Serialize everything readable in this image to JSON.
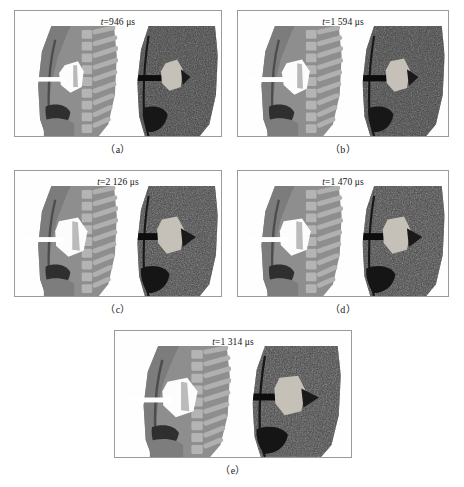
{
  "figure": {
    "type": "multi-panel-scientific-figure",
    "panel_count": 5,
    "background_color": "#ffffff",
    "border_color": "#9a9a9a"
  },
  "panels": [
    {
      "id": "a",
      "caption": "（a）",
      "time_label_prefix": "t",
      "time_label_equals": "=",
      "time_label_value": "946",
      "time_label_unit": "μs",
      "time_label_full": "t=946 μs"
    },
    {
      "id": "b",
      "caption": "（b）",
      "time_label_prefix": "t",
      "time_label_equals": "=",
      "time_label_value": "1 594",
      "time_label_unit": "μs",
      "time_label_full": "t=1 594 μs"
    },
    {
      "id": "c",
      "caption": "（c）",
      "time_label_prefix": "t",
      "time_label_equals": "=",
      "time_label_value": "2 126",
      "time_label_unit": "μs",
      "time_label_full": "t=2 126 μs"
    },
    {
      "id": "d",
      "caption": "（d）",
      "time_label_prefix": "t",
      "time_label_equals": "=",
      "time_label_value": "1 470",
      "time_label_unit": "μs",
      "time_label_full": "t=1 470 μs"
    },
    {
      "id": "e",
      "caption": "（e）",
      "time_label_prefix": "t",
      "time_label_equals": "=",
      "time_label_value": "1 314",
      "time_label_unit": "μs",
      "time_label_full": "t=1 314 μs"
    }
  ],
  "colors": {
    "soft_tissue": "#8e8e8e",
    "soft_tissue_dark": "#787878",
    "bone_light": "#b8b8b8",
    "bone_mid": "#a6a6a6",
    "cavity_dark": "#3a3a3a",
    "cavity_black": "#2b2b2b",
    "fragment_white": "#fdfdfd",
    "track_white": "#ffffff",
    "xray_base": "#4a4a4a",
    "xray_dark": "#2e2e2e",
    "xray_speckle": "#d8d8d8",
    "xray_track_black": "#0d0d0d",
    "xray_fragment": "#c9c4bb",
    "border": "#9a9a9a",
    "text": "#1a1a1a"
  },
  "scene_elements": {
    "illustration": [
      "thorax-soft-tissue-outline",
      "vertebral-column",
      "rib-cage",
      "lung-cavity",
      "diaphragm",
      "projectile-fragment-cluster",
      "wound-track"
    ],
    "radiograph": [
      "speckled-tissue-texture",
      "dark-wound-track",
      "radiopaque-fragment",
      "temporary-cavity"
    ]
  }
}
